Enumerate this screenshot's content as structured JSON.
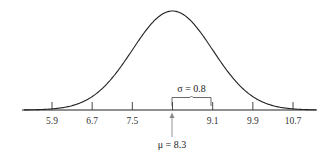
{
  "chart_data": {
    "type": "line",
    "xlabel": "",
    "ylabel": "",
    "mean": 8.3,
    "sd": 0.8,
    "x_ticks": [
      5.9,
      6.7,
      7.5,
      8.3,
      9.1,
      9.9,
      10.7
    ],
    "x_tick_labels": [
      "5.9",
      "6.7",
      "7.5",
      "",
      "9.1",
      "9.9",
      "10.7"
    ],
    "xlim": [
      5.3,
      11.3
    ],
    "grid": false,
    "legend": null,
    "annotations": [
      {
        "text": "σ = 0.8",
        "type": "brace",
        "from": 8.3,
        "to": 9.1
      },
      {
        "text": "μ = 8.3",
        "type": "arrow",
        "at": 8.3
      }
    ]
  },
  "labels": {
    "sigma": "σ = 0.8",
    "mu": "μ = 8.3",
    "ticks": [
      "5.9",
      "6.7",
      "7.5",
      "9.1",
      "9.9",
      "10.7"
    ]
  }
}
